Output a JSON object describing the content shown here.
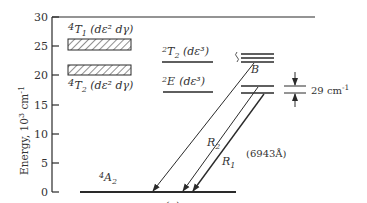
{
  "figure_label": "(a)",
  "axis": {
    "title_prefix": "Energy, 10",
    "title_exp": "3",
    "title_unit": "cm",
    "title_unit_exp": "-1",
    "ticks": [
      "0",
      "5",
      "10",
      "15",
      "20",
      "25",
      "30"
    ]
  },
  "levels": {
    "4T1": {
      "sup": "4",
      "sym": "T",
      "sub": "1",
      "config": "(dε² dγ)"
    },
    "4T2": {
      "sup": "4",
      "sym": "T",
      "sub": "2",
      "config": "(dε² dγ)"
    },
    "2T2": {
      "sup": "2",
      "sym": "T",
      "sub": "2",
      "config": "(dε³)"
    },
    "2E": {
      "sup": "2",
      "sym": "E",
      "sub": "",
      "config": "(dε³)"
    },
    "4A2": {
      "sup": "4",
      "sym": "A",
      "sub": "2"
    }
  },
  "transitions": {
    "B": "B",
    "R2": {
      "sym": "R",
      "sub": "2"
    },
    "R1": {
      "sym": "R",
      "sub": "1"
    },
    "wavelength": "(6943Å)"
  },
  "splitting": {
    "value": "29 cm",
    "exp": "-1"
  },
  "colors": {
    "line": "#2a2a2a",
    "hatch": "#555555"
  }
}
